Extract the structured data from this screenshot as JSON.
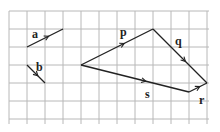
{
  "diagram": {
    "type": "vectors-on-grid",
    "grid": {
      "origin_x": 9,
      "origin_y": 11,
      "cell": 18,
      "cols": 11,
      "rows": 6,
      "color": "#b8b8b8"
    },
    "line_color": "#222222",
    "vectors": [
      {
        "label": "a",
        "from": [
          27,
          47
        ],
        "to": [
          63,
          29
        ],
        "label_pos": [
          32,
          38
        ]
      },
      {
        "label": "b",
        "from": [
          27,
          65
        ],
        "to": [
          45,
          83
        ],
        "label_pos": [
          36,
          71
        ]
      },
      {
        "label": "p",
        "from": [
          81,
          65
        ],
        "to": [
          153,
          29
        ],
        "label_pos": [
          120,
          36
        ]
      },
      {
        "label": "q",
        "from": [
          153,
          29
        ],
        "to": [
          207,
          83
        ],
        "label_pos": [
          175,
          45
        ]
      },
      {
        "label": "r",
        "from": [
          189,
          92
        ],
        "to": [
          207,
          83
        ],
        "label_pos": [
          199,
          104
        ]
      },
      {
        "label": "s",
        "from": [
          81,
          65
        ],
        "to": [
          189,
          92
        ],
        "label_pos": [
          145,
          98
        ]
      }
    ]
  }
}
